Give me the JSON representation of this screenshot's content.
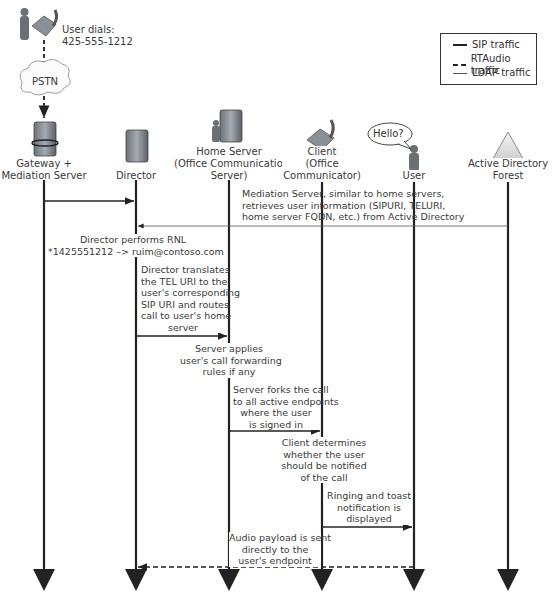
{
  "caller": {
    "dial_label_line1": "User dials:",
    "dial_label_line2": "425-555-1212",
    "network_label": "PSTN"
  },
  "legend": {
    "items": [
      {
        "label": "SIP traffic",
        "style": "solid-thick"
      },
      {
        "label": "RTAudio traffic",
        "style": "dashed"
      },
      {
        "label": "LDAP traffic",
        "style": "solid-thin"
      }
    ]
  },
  "participants": [
    {
      "id": "gateway",
      "icon": "server-icon",
      "line1": "Gateway +",
      "line2": "Mediation Server",
      "line3": ""
    },
    {
      "id": "director",
      "icon": "server-icon",
      "line1": "Director",
      "line2": "",
      "line3": ""
    },
    {
      "id": "home-server",
      "icon": "server-with-user-icon",
      "line1": "Home Server",
      "line2": "(Office Communications",
      "line3": "Server)"
    },
    {
      "id": "client",
      "icon": "phone-icon",
      "line1": "Client",
      "line2": "(Office",
      "line3": "Communicator)"
    },
    {
      "id": "user",
      "icon": "person-icon",
      "line1": "User",
      "line2": "",
      "line3": "",
      "speech": "Hello?"
    },
    {
      "id": "active-directory",
      "icon": "triangle-forest-icon",
      "line1": "Active Directory",
      "line2": "Forest",
      "line3": ""
    }
  ],
  "steps": [
    {
      "id": "ldap-lookup",
      "from": "active-directory",
      "to": "director",
      "type": "LDAP",
      "lines": [
        "Mediation Server, similar to home servers,",
        "retrieves user information (SIPURI, TELURI,",
        "home server FQDN, etc.) from Active Directory"
      ]
    },
    {
      "id": "rnl",
      "type": "note",
      "lines": [
        "Director performs RNL",
        "*1425551212 –> ruim@contoso.com"
      ]
    },
    {
      "id": "route-to-home",
      "from": "director",
      "to": "home-server",
      "type": "SIP",
      "lines": [
        "Director translates",
        "the TEL URI to the",
        "user's corresponding",
        "SIP URI and routes",
        "call to user's home",
        "server"
      ]
    },
    {
      "id": "forwarding",
      "type": "note",
      "lines": [
        "Server applies",
        "user's call forwarding",
        "rules if any"
      ]
    },
    {
      "id": "fork",
      "from": "home-server",
      "to": "client",
      "type": "SIP",
      "lines": [
        "Server forks the call",
        "to all active endpoints",
        "where the user",
        "is signed in"
      ]
    },
    {
      "id": "client-decide",
      "type": "note",
      "lines": [
        "Client determines",
        "whether the user",
        "should be notified",
        "of the call"
      ]
    },
    {
      "id": "ring",
      "from": "client",
      "to": "user",
      "type": "SIP",
      "lines": [
        "Ringing and toast",
        "notification is",
        "displayed"
      ]
    },
    {
      "id": "audio",
      "from": "user",
      "to": "gateway",
      "type": "RTAudio",
      "lines": [
        "Audio payload is sent",
        "directly to the",
        "user's endpoint"
      ]
    }
  ],
  "first_message": {
    "from": "gateway",
    "to": "director",
    "type": "SIP"
  }
}
